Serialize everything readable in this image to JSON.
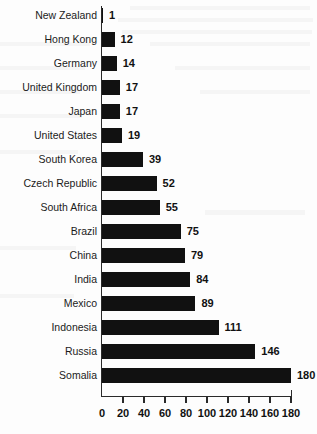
{
  "chart_data": {
    "type": "bar",
    "orientation": "horizontal",
    "title": "",
    "subtitle": "",
    "xlabel": "",
    "ylabel": "",
    "xlim": [
      0,
      180
    ],
    "ylim": null,
    "grid": false,
    "legend": null,
    "bar_color": "#111111",
    "axis_color": "#2a2a2a",
    "background_color": "#fdfdfd",
    "xticks": [
      0,
      20,
      40,
      60,
      80,
      100,
      120,
      140,
      160,
      180
    ],
    "xtick_labels": [
      "0",
      "20",
      "40",
      "60",
      "80",
      "100",
      "120",
      "140",
      "160",
      "180"
    ],
    "categories": [
      "New Zealand",
      "Hong Kong",
      "Germany",
      "United Kingdom",
      "Japan",
      "United States",
      "South Korea",
      "Czech Republic",
      "South Africa",
      "Brazil",
      "China",
      "India",
      "Mexico",
      "Indonesia",
      "Russia",
      "Somalia"
    ],
    "values": [
      1,
      12,
      14,
      17,
      17,
      19,
      39,
      52,
      55,
      75,
      79,
      84,
      89,
      111,
      146,
      180
    ],
    "value_labels": [
      "1",
      "12",
      "14",
      "17",
      "17",
      "19",
      "39",
      "52",
      "55",
      "75",
      "79",
      "84",
      "89",
      "111",
      "146",
      "180"
    ],
    "annotations": []
  }
}
